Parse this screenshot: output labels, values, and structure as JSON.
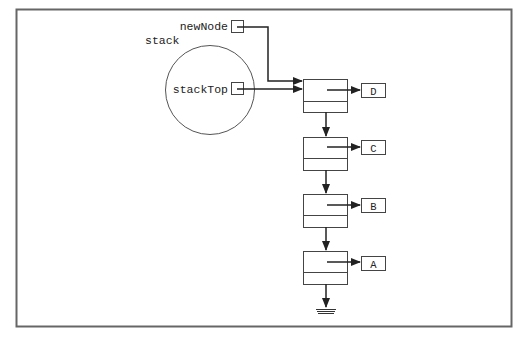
{
  "diagram": {
    "type": "linked-list-stack",
    "labels": {
      "stack": "stack",
      "new_node": "newNode",
      "stack_top": "stackTop"
    },
    "nodes": [
      {
        "value": "D",
        "role": "top"
      },
      {
        "value": "C"
      },
      {
        "value": "B"
      },
      {
        "value": "A",
        "role": "bottom",
        "next": "null"
      }
    ],
    "pointers": [
      {
        "name": "newNode",
        "points_to": "D"
      },
      {
        "name": "stackTop",
        "points_to": "D"
      }
    ],
    "colors": {
      "stroke": "#333333",
      "frame": "#666666",
      "background": "#ffffff"
    }
  }
}
